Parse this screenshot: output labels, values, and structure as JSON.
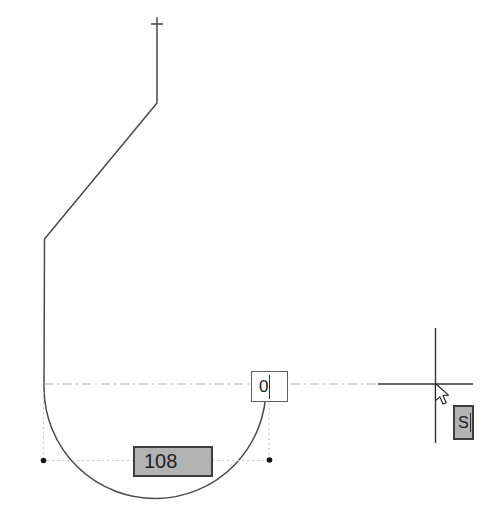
{
  "drawing": {
    "dimension_box": {
      "value": "108"
    },
    "value_box": {
      "value": "0"
    },
    "hint_box": {
      "value": "S"
    }
  },
  "icons": {
    "cursor": "arrow-cursor-icon",
    "start_marker": "cross-marker-icon",
    "endpoints": "endpoint-dot-handles"
  },
  "colors": {
    "background": "#ffffff",
    "outline": "#4a4a4a",
    "construction": "#adadad",
    "dotted": "#c8c8c8",
    "crosshair": "#333333",
    "endpoint_dot": "#151515",
    "box_gray": "#b3b3b3",
    "box_border": "#3e3e3e",
    "input_bg": "#ffffff",
    "input_border": "#606060",
    "text": "#222222"
  }
}
